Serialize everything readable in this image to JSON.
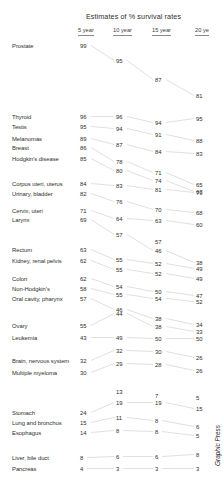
{
  "chart_data": {
    "type": "line",
    "title": "Estimates of % survival rates",
    "xlabel": "",
    "ylabel": "",
    "categories": [
      "5 year",
      "10 year",
      "15 year",
      "20 ye"
    ],
    "legend_position": "none",
    "grid": false,
    "ylim": [
      0,
      100
    ],
    "credit": "Graphic Press",
    "series": [
      {
        "name": "Prostate",
        "values": [
          99,
          95,
          87,
          81
        ]
      },
      {
        "name": "Thyroid",
        "values": [
          96,
          96,
          94,
          95
        ]
      },
      {
        "name": "Testis",
        "values": [
          95,
          94,
          91,
          88
        ]
      },
      {
        "name": "Melanomas",
        "values": [
          89,
          87,
          84,
          83
        ]
      },
      {
        "name": "Breast",
        "values": [
          86,
          78,
          71,
          65
        ]
      },
      {
        "name": "Hodgkin's disease",
        "values": [
          85,
          80,
          74,
          67
        ]
      },
      {
        "name": "Corpus uteri, uterus",
        "values": [
          84,
          83,
          81,
          79
        ]
      },
      {
        "name": "Urinary, bladder",
        "values": [
          82,
          76,
          70,
          68
        ]
      },
      {
        "name": "Cervix, uteri",
        "values": [
          71,
          64,
          63,
          60
        ]
      },
      {
        "name": "Larynx",
        "values": [
          69,
          57,
          46,
          38
        ]
      },
      {
        "name": "Rectum",
        "values": [
          63,
          55,
          52,
          49
        ]
      },
      {
        "name": "Kidney, renal pelvis",
        "values": [
          62,
          55,
          52,
          49
        ]
      },
      {
        "name": "Colon",
        "values": [
          62,
          54,
          50,
          47
        ]
      },
      {
        "name": "Non-Hodgkin's",
        "values": [
          58,
          55,
          54,
          52
        ]
      },
      {
        "name": "Oral cavity, pharynx",
        "values": [
          57,
          46,
          38,
          34
        ]
      },
      {
        "name": "Ovary",
        "values": [
          55,
          44,
          38,
          33
        ]
      },
      {
        "name": "Leukemia",
        "values": [
          43,
          49,
          50,
          50
        ]
      },
      {
        "name": "Brain, nervous system",
        "values": [
          32,
          32,
          30,
          26
        ]
      },
      {
        "name": "Multiple myeloma",
        "values": [
          30,
          29,
          28,
          26
        ]
      },
      {
        "name": "Stomach",
        "values": [
          24,
          19,
          19,
          15
        ]
      },
      {
        "name": "Lung and bronchus",
        "values": [
          15,
          11,
          8,
          6
        ]
      },
      {
        "name": "Esophagus",
        "values": [
          14,
          8,
          8,
          5
        ]
      },
      {
        "name": "Liver, bile duct",
        "values": [
          8,
          6,
          6,
          8
        ]
      },
      {
        "name": "Pancreas",
        "values": [
          4,
          3,
          3,
          3
        ]
      }
    ]
  },
  "header": {
    "title": "Estimates of % survival rates",
    "columns": [
      {
        "label": "5 year"
      },
      {
        "label": "10 year"
      },
      {
        "label": "15 year"
      },
      {
        "label": "20 ye"
      }
    ]
  },
  "rows": [
    {
      "label": "Prostate",
      "v": [
        "99",
        "95",
        "87",
        "81"
      ],
      "y": [
        47,
        62,
        81,
        97
      ],
      "ly": 47
    },
    {
      "label": "Thyroid",
      "v": [
        "96",
        "96",
        "94",
        "95"
      ],
      "y": [
        118,
        118,
        124,
        120
      ],
      "ly": 118
    },
    {
      "label": "Testis",
      "v": [
        "95",
        "94",
        "91",
        "88"
      ],
      "y": [
        128,
        130,
        136,
        142
      ],
      "ly": 128
    },
    {
      "label": "Melanomas",
      "v": [
        "89",
        "87",
        "84",
        "83"
      ],
      "y": [
        140,
        146,
        153,
        155
      ],
      "ly": 140
    },
    {
      "label": "Breast",
      "v": [
        "86",
        "78",
        "71",
        "65"
      ],
      "y": [
        149,
        163,
        174,
        186
      ],
      "ly": 149
    },
    {
      "label": "Hodgkin's disease",
      "v": [
        "85",
        "80",
        "74",
        "67"
      ],
      "y": [
        160,
        172,
        182,
        193
      ],
      "ly": 160
    },
    {
      "label": "Corpus uteri, uterus",
      "v": [
        "84",
        "83",
        "81",
        "79"
      ],
      "y": [
        185,
        187,
        191,
        194
      ],
      "ly": 185
    },
    {
      "label": "Urinary, bladder",
      "v": [
        "82",
        "76",
        "70",
        "68"
      ],
      "y": [
        195,
        203,
        211,
        214
      ],
      "ly": 195
    },
    {
      "label": "Cervix, uteri",
      "v": [
        "71",
        "64",
        "63",
        "60"
      ],
      "y": [
        212,
        220,
        222,
        226
      ],
      "ly": 212
    },
    {
      "label": "Larynx",
      "v": [
        "69",
        "57",
        "46",
        "38"
      ],
      "y": [
        221,
        236,
        252,
        264
      ],
      "ly": 221
    },
    {
      "label": "Rectum",
      "v": [
        "63",
        "55",
        "52",
        "49"
      ],
      "y": [
        251,
        261,
        265,
        270
      ],
      "ly": 251
    },
    {
      "label": "Kidney, renal pelvis",
      "v": [
        "62",
        "55",
        "52",
        "49"
      ],
      "y": [
        262,
        271,
        275,
        280
      ],
      "ly": 262
    },
    {
      "label": "Colon",
      "v": [
        "62",
        "54",
        "50",
        "47"
      ],
      "y": [
        280,
        288,
        293,
        297
      ],
      "ly": 280
    },
    {
      "label": "Non-Hodgkin's",
      "v": [
        "58",
        "55",
        "54",
        "52"
      ],
      "y": [
        290,
        296,
        300,
        303
      ],
      "ly": 290
    },
    {
      "label": "Oral cavity, pharynx",
      "v": [
        "57",
        "46",
        "38",
        "34"
      ],
      "y": [
        300,
        311,
        320,
        326
      ],
      "ly": 300
    },
    {
      "label": "Ovary",
      "v": [
        "55",
        "44",
        "38",
        "33"
      ],
      "y": [
        327,
        315,
        328,
        333
      ],
      "ly": 327
    },
    {
      "label": "Leukemia",
      "v": [
        "43",
        "49",
        "50",
        "50"
      ],
      "y": [
        339,
        339,
        340,
        340
      ],
      "ly": 339
    },
    {
      "label": "Brain, nervous system",
      "v": [
        "32",
        "32",
        "30",
        "26"
      ],
      "y": [
        362,
        352,
        353,
        359
      ],
      "ly": 362
    },
    {
      "label": "Multiple myeloma",
      "v": [
        "30",
        "29",
        "28",
        "26"
      ],
      "y": [
        374,
        365,
        366,
        372
      ],
      "ly": 374
    },
    {
      "label": "Stomach",
      "v": [
        "24",
        "19",
        "19",
        "15"
      ],
      "y": [
        414,
        404,
        404,
        410
      ],
      "ly": 414
    },
    {
      "label": "Lung and bronchus",
      "v": [
        "15",
        "11",
        "8",
        "6"
      ],
      "y": [
        424,
        419,
        422,
        428
      ],
      "ly": 424
    },
    {
      "label": "Esophagus",
      "v": [
        "14",
        "8",
        "8",
        "5"
      ],
      "y": [
        434,
        432,
        433,
        437
      ],
      "ly": 434
    },
    {
      "label": "Liver, bile duct",
      "v": [
        "8",
        "6",
        "6",
        "8"
      ],
      "y": [
        459,
        458,
        458,
        456
      ],
      "ly": 459
    },
    {
      "label": "Pancreas",
      "v": [
        "4",
        "3",
        "3",
        "3"
      ],
      "y": [
        470,
        470,
        470,
        470
      ],
      "ly": 470
    }
  ],
  "extra_nodes": [
    {
      "v": "57",
      "x": 2,
      "y": 243
    },
    {
      "v": "13",
      "x": 1,
      "y": 393
    },
    {
      "v": "7",
      "x": 2,
      "y": 397
    },
    {
      "v": "5",
      "x": 3,
      "y": 399
    }
  ],
  "credit": {
    "label": "Graphic Press"
  }
}
